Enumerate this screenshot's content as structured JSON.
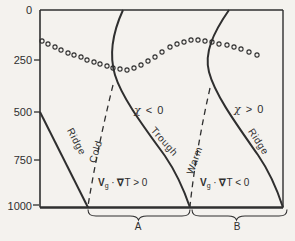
{
  "figure": {
    "y_axis": {
      "pressure_labels": [
        "0",
        "250",
        "500",
        "750",
        "1000"
      ]
    },
    "axis_labels": {
      "ridge_left": "Ridge",
      "cold": "Cold",
      "trough": "Trough",
      "warm": "Warm",
      "ridge_right": "Ridge"
    },
    "annotations": {
      "chi_negative": {
        "symbol": "χ",
        "relation": " < 0"
      },
      "chi_positive": {
        "symbol": "χ",
        "relation": " > 0"
      },
      "advection_left": {
        "vector": "V",
        "sub": "g",
        "dot": " · ",
        "nabla": "∇",
        "rest": "T > 0"
      },
      "advection_right": {
        "vector": "V",
        "sub": "g",
        "dot": " · ",
        "nabla": "∇",
        "rest": "T < 0"
      }
    },
    "braces": {
      "left": "A",
      "right": "B"
    },
    "tropopause_points": [
      [
        42,
        41
      ],
      [
        48,
        44
      ],
      [
        55,
        47
      ],
      [
        61,
        50
      ],
      [
        68,
        53
      ],
      [
        74,
        55
      ],
      [
        81,
        57
      ],
      [
        87,
        60
      ],
      [
        94,
        62
      ],
      [
        100,
        64
      ],
      [
        107,
        66
      ],
      [
        113,
        68
      ],
      [
        120,
        69
      ],
      [
        127,
        70
      ],
      [
        134,
        68
      ],
      [
        141,
        65
      ],
      [
        148,
        61
      ],
      [
        155,
        57
      ],
      [
        162,
        52
      ],
      [
        170,
        47
      ],
      [
        177,
        44
      ],
      [
        184,
        42
      ],
      [
        191,
        40
      ],
      [
        198,
        40
      ],
      [
        205,
        41
      ],
      [
        212,
        42
      ],
      [
        219,
        44
      ],
      [
        227,
        45
      ],
      [
        234,
        47
      ],
      [
        241,
        49
      ],
      [
        249,
        52
      ],
      [
        257,
        55
      ]
    ],
    "colors": {
      "ink": "#2f2f2f",
      "paper": "#f4f2ee"
    }
  }
}
